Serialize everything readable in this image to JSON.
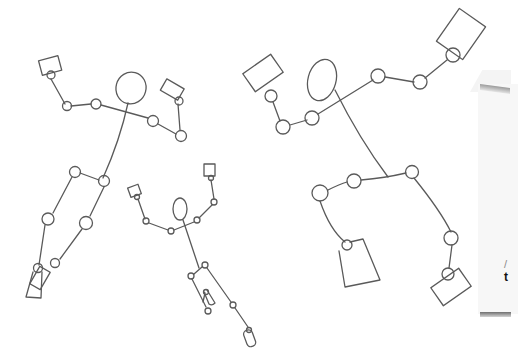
{
  "image": {
    "description": "Hand-drawn pencil sketches of pose skeletons (stick figures with circular joints, oval heads and rectangular hands/feet) on white paper, with the edge of a folded paper sheet at the right",
    "background_color": "#ffffff",
    "stroke_color": "#5a5a5a"
  },
  "figures": [
    {
      "name": "figure-left",
      "parts": [
        "head-oval",
        "shoulder-line",
        "left-arm",
        "right-arm",
        "hand-boxes",
        "spine",
        "hips",
        "legs",
        "feet"
      ]
    },
    {
      "name": "figure-small-center",
      "parts": [
        "head-oval",
        "arms-raised",
        "hand-boxes",
        "spine",
        "hips",
        "legs",
        "foot-capsule"
      ]
    },
    {
      "name": "figure-right",
      "parts": [
        "head-oval",
        "arms-outstretched",
        "hand-boxes",
        "spine",
        "hip-line",
        "legs",
        "foot-boxes"
      ]
    }
  ],
  "paper_edge": {
    "text_fragments": [
      "/",
      "t"
    ]
  }
}
